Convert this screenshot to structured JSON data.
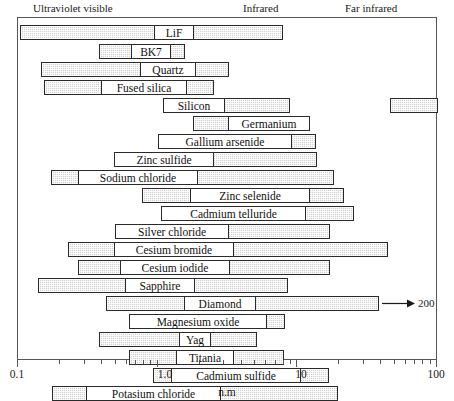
{
  "figure": {
    "axis_title": "n.m",
    "region_labels": [
      {
        "text": "Ultraviolet visible",
        "x": 33
      },
      {
        "text": "Infrared",
        "x": 243
      },
      {
        "text": "Far infrared",
        "x": 345
      }
    ],
    "axis_tick_labels": [
      {
        "text": "0.1",
        "x": 17
      },
      {
        "text": "1.0",
        "x": 165
      },
      {
        "text": "10",
        "x": 301
      },
      {
        "text": "100",
        "x": 436
      }
    ],
    "annotation": {
      "arrow_value": "200",
      "arrow_start_x": 381,
      "arrow_end_x": 414,
      "value_x": 417
    },
    "colors": {
      "bar_fill": "#d0d0d0",
      "bar_border": "#2a2a2a",
      "label_fill": "#ffffff",
      "frame": "#555555",
      "text": "#1a1a1a"
    }
  },
  "chart_data": {
    "type": "bar",
    "xlabel": "n.m",
    "ylabel": "",
    "xscale": "log",
    "xlim": [
      0.1,
      100
    ],
    "xticks": [
      0.1,
      1.0,
      10,
      100
    ],
    "grid": false,
    "legend": null,
    "region_annotations": [
      "Ultraviolet visible",
      "Infrared",
      "Far infrared"
    ],
    "note": "Each row is a material transmission band drawn as a horizontal bar spanning its wavelength range in micrometres (axis labelled n.m). Bar label boxes sit inside the bar.",
    "categories": [
      "LiF",
      "BK7",
      "Quartz",
      "Fused silica",
      "Silicon",
      "Germanium",
      "Gallium arsenide",
      "Zinc sulfide",
      "Sodium chloride",
      "Zinc selenide",
      "Cadmium telluride",
      "Silver chloride",
      "Cesium bromide",
      "Cesium iodide",
      "Sapphire",
      "Diamond",
      "Magnesium oxide",
      "Yag",
      "Titania",
      "Cadmium sulfide",
      "Potasium chloride",
      "Irtran 4",
      "Barium fluoride"
    ],
    "bars": [
      {
        "name": "LiF",
        "row": 0,
        "y": 24,
        "segments": [
          {
            "x": 19,
            "w": 263
          }
        ],
        "label": {
          "text": "LiF",
          "x": 153,
          "w": 40
        },
        "range_um": [
          0.11,
          7.0
        ]
      },
      {
        "name": "BK7",
        "row": 1,
        "y": 43,
        "segments": [
          {
            "x": 98,
            "w": 86
          }
        ],
        "label": {
          "text": "BK7",
          "x": 130,
          "w": 40
        },
        "range_um": [
          0.35,
          2.7
        ]
      },
      {
        "name": "Quartz",
        "row": 2,
        "y": 61,
        "segments": [
          {
            "x": 40,
            "w": 188
          }
        ],
        "label": {
          "text": "Quartz",
          "x": 139,
          "w": 56
        },
        "range_um": [
          0.18,
          4.5
        ]
      },
      {
        "name": "Fused silica",
        "row": 3,
        "y": 79,
        "segments": [
          {
            "x": 43,
            "w": 170
          }
        ],
        "label": {
          "text": "Fused silica",
          "x": 100,
          "w": 86
        },
        "range_um": [
          0.19,
          3.7
        ]
      },
      {
        "name": "Silicon",
        "row": 4,
        "y": 97,
        "segments": [
          {
            "x": 162,
            "w": 127
          },
          {
            "x": 389,
            "w": 48
          }
        ],
        "label": {
          "text": "Silicon",
          "x": 162,
          "w": 62
        },
        "range_um": [
          1.1,
          8.5
        ]
      },
      {
        "name": "Germanium",
        "row": 5,
        "y": 115,
        "segments": [
          {
            "x": 192,
            "w": 117
          }
        ],
        "label": {
          "text": "Germanium",
          "x": 227,
          "w": 82
        },
        "range_um": [
          1.7,
          14.0
        ]
      },
      {
        "name": "Gallium arsenide",
        "row": 6,
        "y": 133,
        "segments": [
          {
            "x": 157,
            "w": 158
          }
        ],
        "label": {
          "text": "Gallium arsenide",
          "x": 157,
          "w": 134
        },
        "range_um": [
          1.0,
          15.0
        ]
      },
      {
        "name": "Zinc sulfide",
        "row": 7,
        "y": 151,
        "segments": [
          {
            "x": 113,
            "w": 203
          }
        ],
        "label": {
          "text": "Zinc sulfide",
          "x": 113,
          "w": 100
        },
        "range_um": [
          0.4,
          15.0
        ]
      },
      {
        "name": "Sodium chloride",
        "row": 8,
        "y": 169,
        "segments": [
          {
            "x": 50,
            "w": 283
          }
        ],
        "label": {
          "text": "Sodium chloride",
          "x": 77,
          "w": 120
        },
        "range_um": [
          0.2,
          20.0
        ]
      },
      {
        "name": "Zinc selenide",
        "row": 9,
        "y": 187,
        "segments": [
          {
            "x": 141,
            "w": 202
          }
        ],
        "label": {
          "text": "Zinc selenide",
          "x": 189,
          "w": 120
        },
        "range_um": [
          0.6,
          22.0
        ]
      },
      {
        "name": "Cadmium telluride",
        "row": 10,
        "y": 205,
        "segments": [
          {
            "x": 160,
            "w": 193
          }
        ],
        "label": {
          "text": "Cadmium telluride",
          "x": 160,
          "w": 145
        },
        "range_um": [
          1.0,
          26.0
        ]
      },
      {
        "name": "Silver chloride",
        "row": 11,
        "y": 223,
        "segments": [
          {
            "x": 114,
            "w": 215
          }
        ],
        "label": {
          "text": "Silver chloride",
          "x": 114,
          "w": 114
        },
        "range_um": [
          0.4,
          22.0
        ]
      },
      {
        "name": "Cesium bromide",
        "row": 12,
        "y": 241,
        "segments": [
          {
            "x": 67,
            "w": 320
          }
        ],
        "label": {
          "text": "Cesium bromide",
          "x": 113,
          "w": 120
        },
        "range_um": [
          0.25,
          45.0
        ]
      },
      {
        "name": "Cesium iodide",
        "row": 13,
        "y": 259,
        "segments": [
          {
            "x": 77,
            "w": 252
          }
        ],
        "label": {
          "text": "Cesium iodide",
          "x": 119,
          "w": 110
        },
        "range_um": [
          0.28,
          28.0
        ]
      },
      {
        "name": "Sapphire",
        "row": 14,
        "y": 277,
        "segments": [
          {
            "x": 37,
            "w": 250
          }
        ],
        "label": {
          "text": "Sapphire",
          "x": 124,
          "w": 70
        },
        "range_um": [
          0.17,
          6.5
        ]
      },
      {
        "name": "Diamond",
        "row": 15,
        "y": 295,
        "segments": [
          {
            "x": 105,
            "w": 273
          }
        ],
        "label": {
          "text": "Diamond",
          "x": 183,
          "w": 72
        },
        "range_um": [
          0.3,
          200.0
        ],
        "has_arrow": true
      },
      {
        "name": "Magnesium oxide",
        "row": 16,
        "y": 313,
        "segments": [
          {
            "x": 128,
            "w": 156
          }
        ],
        "label": {
          "text": "Magnesium oxide",
          "x": 128,
          "w": 138
        },
        "range_um": [
          0.4,
          8.5
        ]
      },
      {
        "name": "Yag",
        "row": 17,
        "y": 331,
        "segments": [
          {
            "x": 98,
            "w": 158
          }
        ],
        "label": {
          "text": "Yag",
          "x": 178,
          "w": 32
        },
        "range_um": [
          0.3,
          6.0
        ]
      },
      {
        "name": "Titania",
        "row": 18,
        "y": 349,
        "segments": [
          {
            "x": 128,
            "w": 155
          }
        ],
        "label": {
          "text": "Titania",
          "x": 175,
          "w": 58
        },
        "range_um": [
          0.4,
          6.2
        ]
      },
      {
        "name": "Cadmium sulfide",
        "row": 19,
        "y": 367,
        "segments": [
          {
            "x": 152,
            "w": 176
          }
        ],
        "label": {
          "text": "Cadmium sulfide",
          "x": 170,
          "w": 130
        },
        "range_um": [
          0.55,
          16.0
        ]
      },
      {
        "name": "Potasium chloride",
        "row": 20,
        "y": 385,
        "segments": [
          {
            "x": 51,
            "w": 286
          }
        ],
        "label": {
          "text": "Potasium chloride",
          "x": 85,
          "w": 135
        },
        "range_um": [
          0.2,
          25.0
        ]
      },
      {
        "name": "Irtran 4",
        "row": 21,
        "y": 403,
        "segments": [
          {
            "x": 124,
            "w": 223
          }
        ],
        "label": {
          "text": "Irtran 4",
          "x": 164,
          "w": 58
        },
        "range_um": [
          0.5,
          22.0
        ]
      },
      {
        "name": "Barium fluoride",
        "row": 22,
        "y": 421,
        "segments": [
          {
            "x": 33,
            "w": 291
          }
        ],
        "label": {
          "text": "Barium fluoride",
          "x": 95,
          "w": 118
        },
        "range_um": [
          0.15,
          14.0
        ]
      }
    ]
  }
}
